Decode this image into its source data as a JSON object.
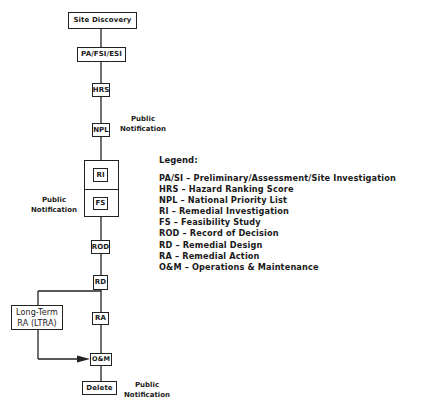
{
  "diagram": {
    "type": "flowchart",
    "nodes": {
      "site_discovery": "Site Discovery",
      "pa_fsi_esi": "PA/FSI/ESI",
      "hrs": "HRS",
      "npl": "NPL",
      "ri": "RI",
      "fs": "FS",
      "rod": "ROD",
      "rd": "RD",
      "ra": "RA",
      "ltra_line1": "Long-Term",
      "ltra_line2": "RA (LTRA)",
      "om": "O&M",
      "delete": "Delete"
    },
    "notes": {
      "npl_public": "Public",
      "npl_notification": "Notification",
      "rifs_public": "Public",
      "rifs_notification": "Notification",
      "delete_public": "Public",
      "delete_notification": "Notification"
    },
    "edges": [
      [
        "Site Discovery",
        "PA/FSI/ESI"
      ],
      [
        "PA/FSI/ESI",
        "HRS"
      ],
      [
        "HRS",
        "NPL"
      ],
      [
        "NPL",
        "RI"
      ],
      [
        "RI",
        "FS"
      ],
      [
        "FS",
        "ROD"
      ],
      [
        "ROD",
        "RD"
      ],
      [
        "RD",
        "RA"
      ],
      [
        "RD",
        "Long-Term RA (LTRA)"
      ],
      [
        "RA",
        "O&M"
      ],
      [
        "Long-Term RA (LTRA)",
        "O&M"
      ],
      [
        "O&M",
        "Delete"
      ]
    ]
  },
  "legend": {
    "title": "Legend:",
    "items": [
      "PA/SI  –  Preliminary/Assessment/Site Investigation",
      "HRS  –  Hazard Ranking Score",
      "NPL  –  National Priority List",
      "RI  –  Remedial Investigation",
      "FS  –  Feasibility Study",
      "ROD  –  Record of Decision",
      "RD  –  Remedial Design",
      "RA  –  Remedial Action",
      "O&M  –  Operations & Maintenance"
    ]
  },
  "colors": {
    "line": "#222222",
    "background": "#ffffff"
  }
}
